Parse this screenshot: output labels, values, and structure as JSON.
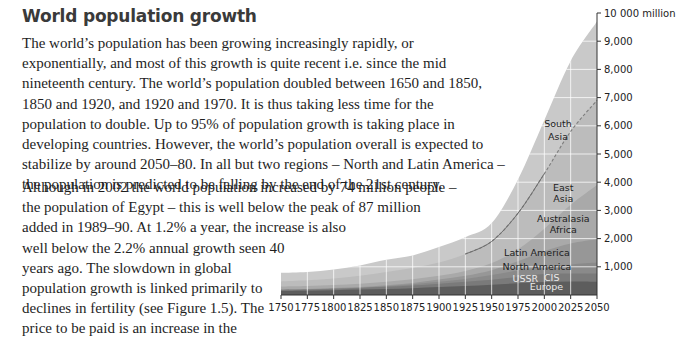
{
  "article": {
    "title": "World population growth",
    "paragraph1_lines": [
      "The world’s population has been growing increasingly rapidly, or",
      "exponentially, and most of this growth is quite recent i.e. since the mid",
      "nineteenth century. The world’s population doubled between 1650 and 1850,",
      "1850 and 1920, and 1920 and 1970. It is thus taking less time for the",
      "population to double. Up to 95% of population growth is taking place in",
      "developing countries. However, the world’s population overall is expected to",
      "stabilize by around 2050–80. In all but two regions – North and Latin America –",
      "the population is predicted to be falling by the end of the 21st century."
    ],
    "paragraph2_lines": [
      "Although in 2002 the world population increased by 74 million people –",
      "the population of Egypt – this is well below the peak of 87 million",
      "added in 1989–90. At 1.2% a year, the increase is also",
      "well below the 2.2% annual growth seen 40",
      "years ago. The slowdown in global",
      "population growth is linked primarily to",
      "declines in fertility (see Figure 1.5). The",
      "price to be paid is an increase in the"
    ]
  },
  "chart_data": {
    "type": "area",
    "xlabel": "",
    "ylabel": "million",
    "x_ticks": [
      1750,
      1775,
      1800,
      1825,
      1850,
      1875,
      1900,
      1925,
      1950,
      1975,
      2000,
      2025,
      2050
    ],
    "y_ticks": [
      {
        "value": 1000,
        "label": "1,000"
      },
      {
        "value": 2000,
        "label": "2,000"
      },
      {
        "value": 3000,
        "label": "3,000"
      },
      {
        "value": 4000,
        "label": "4,000"
      },
      {
        "value": 5000,
        "label": "5,000"
      },
      {
        "value": 6000,
        "label": "6,000"
      },
      {
        "value": 7000,
        "label": "7,000"
      },
      {
        "value": 8000,
        "label": "8,000"
      },
      {
        "value": 9000,
        "label": "9,000"
      },
      {
        "value": 10000,
        "label": "10 000 million"
      }
    ],
    "xlim": [
      1750,
      2050
    ],
    "ylim": [
      0,
      10000
    ],
    "grid": true,
    "stacked": true,
    "x": [
      1750,
      1775,
      1800,
      1825,
      1850,
      1875,
      1900,
      1925,
      1950,
      1975,
      2000,
      2025,
      2050
    ],
    "series_cumulative": [
      {
        "name": "Europe",
        "color": "#5d5d5d",
        "values": [
          140,
          150,
          170,
          190,
          210,
          240,
          280,
          320,
          360,
          420,
          460,
          480,
          470
        ]
      },
      {
        "name": "USSR / CIS",
        "color": "#7a7a7a",
        "values": [
          180,
          195,
          220,
          250,
          290,
          340,
          400,
          470,
          540,
          640,
          740,
          760,
          760
        ]
      },
      {
        "name": "North America",
        "color": "#8a8a8a",
        "values": [
          185,
          200,
          225,
          260,
          310,
          380,
          470,
          570,
          710,
          870,
          1000,
          1080,
          1150
        ]
      },
      {
        "name": "Latin America",
        "color": "#979797",
        "values": [
          200,
          215,
          245,
          285,
          345,
          430,
          545,
          680,
          880,
          1200,
          1560,
          1830,
          1980
        ]
      },
      {
        "name": "Africa / Australasia",
        "color": "#a9a9a9",
        "values": [
          300,
          320,
          350,
          400,
          470,
          560,
          680,
          850,
          1130,
          1620,
          2350,
          3200,
          3900
        ]
      },
      {
        "name": "East Asia",
        "color": "#bcbcbc",
        "values": [
          480,
          520,
          580,
          680,
          820,
          960,
          1150,
          1450,
          1900,
          2900,
          4300,
          5800,
          6900
        ]
      },
      {
        "name": "South Asia",
        "color": "#c9c9c9",
        "values": [
          790,
          820,
          900,
          1050,
          1250,
          1400,
          1700,
          2050,
          2550,
          4100,
          6200,
          8300,
          9700
        ]
      }
    ],
    "annotations": [
      {
        "text": "South",
        "year": 2013,
        "value": 5950
      },
      {
        "text": "Asia",
        "year": 2013,
        "value": 5500
      },
      {
        "text": "East",
        "year": 2018,
        "value": 3700
      },
      {
        "text": "Asia",
        "year": 2018,
        "value": 3300
      },
      {
        "text": "Australasia",
        "year": 2018,
        "value": 2600
      },
      {
        "text": "Africa",
        "year": 2018,
        "value": 2200
      },
      {
        "text": "Latin America",
        "year": 1993,
        "value": 1380
      },
      {
        "text": "North America",
        "year": 1993,
        "value": 900
      },
      {
        "text": "USSR",
        "year": 1982,
        "value": 450
      },
      {
        "text": "CIS",
        "year": 2007,
        "value": 480
      },
      {
        "text": "Europe",
        "year": 2002,
        "value": 160
      }
    ],
    "dashed_line": {
      "name": "developing-world boundary",
      "points": [
        [
          1925,
          1450
        ],
        [
          1950,
          1900
        ],
        [
          1975,
          2900
        ],
        [
          2000,
          4300
        ],
        [
          2025,
          5800
        ],
        [
          2050,
          6900
        ]
      ]
    }
  }
}
